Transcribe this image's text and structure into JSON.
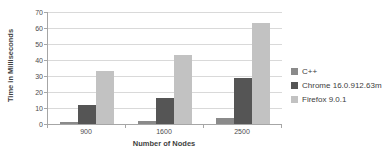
{
  "chart_data": {
    "type": "bar",
    "title": "",
    "categories": [
      "900",
      "1600",
      "2500"
    ],
    "series": [
      {
        "name": "C++",
        "color": "#8a8a8a",
        "values": [
          1,
          2,
          4
        ]
      },
      {
        "name": "Chrome 16.0.912.63m",
        "color": "#555555",
        "values": [
          12,
          16,
          29
        ]
      },
      {
        "name": "Firefox 9.0.1",
        "color": "#c2c2c2",
        "values": [
          33,
          43,
          63
        ]
      }
    ],
    "xlabel": "Number of Nodes",
    "ylabel": "Time in Milliseconds",
    "ylim": [
      0,
      70
    ],
    "yticks": [
      0,
      10,
      20,
      30,
      40,
      50,
      60,
      70
    ],
    "grid": true,
    "legend_position": "right"
  },
  "colors": {
    "background": "#ffffff",
    "gridline": "#d9d9d9",
    "axis": "#a6a6a6",
    "text": "#404040"
  }
}
